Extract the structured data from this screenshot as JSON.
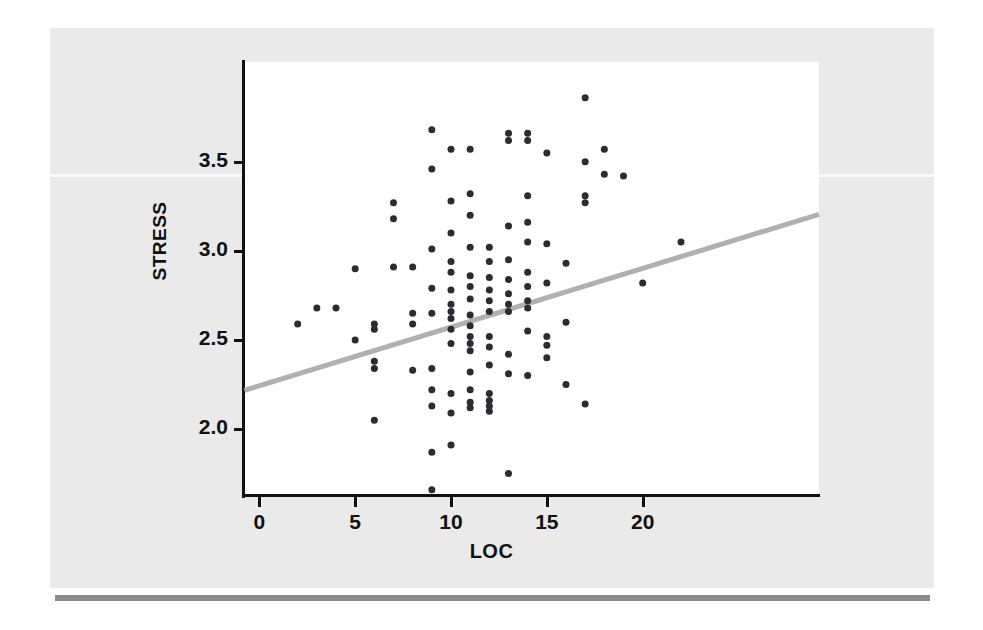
{
  "figure": {
    "background_color": "#eaeaea",
    "canvas_color": "#ffffff",
    "rule_color": "#8a8a8a"
  },
  "chart_data": {
    "type": "scatter",
    "title": "",
    "subtitle": "",
    "xlabel": "LOC",
    "ylabel": "STRESS",
    "xlim": [
      -0.8,
      29.2
    ],
    "ylim": [
      1.63,
      4.06
    ],
    "xticks": [
      0,
      5,
      10,
      15,
      20
    ],
    "xtick_labels": [
      "0",
      "5",
      "10",
      "15",
      "20"
    ],
    "yticks": [
      2.0,
      2.5,
      3.0,
      3.5
    ],
    "ytick_labels": [
      "2.0",
      "2.5",
      "3.0",
      "3.5"
    ],
    "grid": false,
    "legend": null,
    "annotations": [],
    "marker": {
      "shape": "circle",
      "color": "#2b2b33",
      "size": 7
    },
    "trendline": {
      "type": "linear_fit",
      "color": "#b0b0b0",
      "width": 5,
      "x_start": -0.78,
      "y_start": 2.217,
      "x_end": 29.2,
      "y_end": 3.205
    },
    "points": [
      [
        2,
        2.59
      ],
      [
        3,
        2.68
      ],
      [
        4,
        2.68
      ],
      [
        5,
        2.5
      ],
      [
        5,
        2.9
      ],
      [
        6,
        2.05
      ],
      [
        6,
        2.34
      ],
      [
        6,
        2.38
      ],
      [
        6,
        2.56
      ],
      [
        6,
        2.59
      ],
      [
        7,
        3.18
      ],
      [
        7,
        2.91
      ],
      [
        7,
        3.27
      ],
      [
        8,
        2.33
      ],
      [
        8,
        2.59
      ],
      [
        8,
        2.65
      ],
      [
        8,
        2.91
      ],
      [
        9,
        1.66
      ],
      [
        9,
        1.87
      ],
      [
        9,
        2.13
      ],
      [
        9,
        2.22
      ],
      [
        9,
        2.34
      ],
      [
        9,
        2.65
      ],
      [
        9,
        2.79
      ],
      [
        9,
        3.01
      ],
      [
        9,
        3.46
      ],
      [
        9,
        3.68
      ],
      [
        10,
        1.91
      ],
      [
        10,
        2.09
      ],
      [
        10,
        2.2
      ],
      [
        10,
        2.48
      ],
      [
        10,
        2.56
      ],
      [
        10,
        2.62
      ],
      [
        10,
        2.66
      ],
      [
        10,
        2.7
      ],
      [
        10,
        2.78
      ],
      [
        10,
        2.88
      ],
      [
        10,
        2.94
      ],
      [
        10,
        3.1
      ],
      [
        10,
        3.28
      ],
      [
        10,
        3.57
      ],
      [
        11,
        2.12
      ],
      [
        11,
        2.15
      ],
      [
        11,
        2.22
      ],
      [
        11,
        2.32
      ],
      [
        11,
        2.44
      ],
      [
        11,
        2.48
      ],
      [
        11,
        2.52
      ],
      [
        11,
        2.58
      ],
      [
        11,
        2.64
      ],
      [
        11,
        2.73
      ],
      [
        11,
        2.8
      ],
      [
        11,
        2.86
      ],
      [
        11,
        3.02
      ],
      [
        11,
        3.2
      ],
      [
        11,
        3.32
      ],
      [
        11,
        3.57
      ],
      [
        12,
        2.1
      ],
      [
        12,
        2.13
      ],
      [
        12,
        2.16
      ],
      [
        12,
        2.2
      ],
      [
        12,
        2.36
      ],
      [
        12,
        2.46
      ],
      [
        12,
        2.52
      ],
      [
        12,
        2.66
      ],
      [
        12,
        2.72
      ],
      [
        12,
        2.78
      ],
      [
        12,
        2.85
      ],
      [
        12,
        2.94
      ],
      [
        12,
        3.02
      ],
      [
        13,
        1.75
      ],
      [
        13,
        2.31
      ],
      [
        13,
        2.42
      ],
      [
        13,
        2.66
      ],
      [
        13,
        2.7
      ],
      [
        13,
        2.76
      ],
      [
        13,
        2.84
      ],
      [
        13,
        2.95
      ],
      [
        13,
        3.14
      ],
      [
        13,
        3.62
      ],
      [
        13,
        3.66
      ],
      [
        14,
        2.3
      ],
      [
        14,
        2.55
      ],
      [
        14,
        2.68
      ],
      [
        14,
        2.72
      ],
      [
        14,
        2.8
      ],
      [
        14,
        2.88
      ],
      [
        14,
        3.05
      ],
      [
        14,
        3.16
      ],
      [
        14,
        3.31
      ],
      [
        14,
        3.62
      ],
      [
        14,
        3.66
      ],
      [
        15,
        2.4
      ],
      [
        15,
        2.47
      ],
      [
        15,
        2.52
      ],
      [
        15,
        2.82
      ],
      [
        15,
        3.04
      ],
      [
        15,
        3.55
      ],
      [
        16,
        2.25
      ],
      [
        16,
        2.6
      ],
      [
        16,
        2.93
      ],
      [
        17,
        2.14
      ],
      [
        17,
        3.27
      ],
      [
        17,
        3.31
      ],
      [
        17,
        3.5
      ],
      [
        17,
        3.86
      ],
      [
        18,
        3.43
      ],
      [
        18,
        3.57
      ],
      [
        19,
        3.42
      ],
      [
        20,
        2.82
      ],
      [
        22,
        3.05
      ]
    ]
  }
}
